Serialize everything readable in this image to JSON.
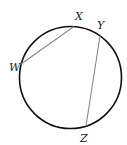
{
  "diagram": {
    "type": "circle-with-chords",
    "circle": {
      "cx": 70.5,
      "cy": 77.5,
      "r": 51,
      "stroke": "#111111"
    },
    "chords": [
      {
        "name": "WX",
        "from": "W",
        "to": "X",
        "stroke": "#8a8a8a"
      },
      {
        "name": "YZ",
        "from": "Y",
        "to": "Z",
        "stroke": "#8a8a8a"
      }
    ],
    "points": {
      "W": {
        "x": 20.5,
        "y": 64.5,
        "label": "W",
        "lx": 9,
        "ly": 71
      },
      "X": {
        "x": 74,
        "y": 26.5,
        "label": "X",
        "lx": 75,
        "ly": 20
      },
      "Y": {
        "x": 100,
        "y": 36,
        "label": "Y",
        "lx": 97,
        "ly": 29
      },
      "Z": {
        "x": 86,
        "y": 126,
        "label": "Z",
        "lx": 80,
        "ly": 142
      }
    }
  }
}
